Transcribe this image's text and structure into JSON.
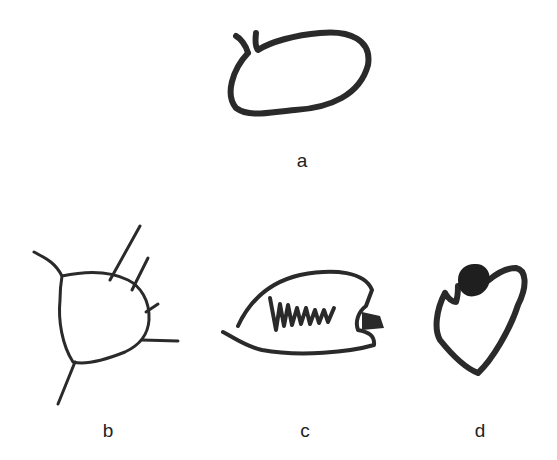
{
  "figure": {
    "panels": [
      {
        "id": "a",
        "label": "a",
        "description": "oval outline with two short antenna-like strokes at upper left"
      },
      {
        "id": "b",
        "label": "b",
        "description": "rounded triangular outline with radiating lines"
      },
      {
        "id": "c",
        "label": "c",
        "description": "lens-shaped outline with zigzag scribble and dark filled notch at right"
      },
      {
        "id": "d",
        "label": "d",
        "description": "heart-shaped outline with dark filled scribble at top"
      }
    ],
    "colors": {
      "ink": "#2a2a2a",
      "background": "#ffffff"
    }
  }
}
